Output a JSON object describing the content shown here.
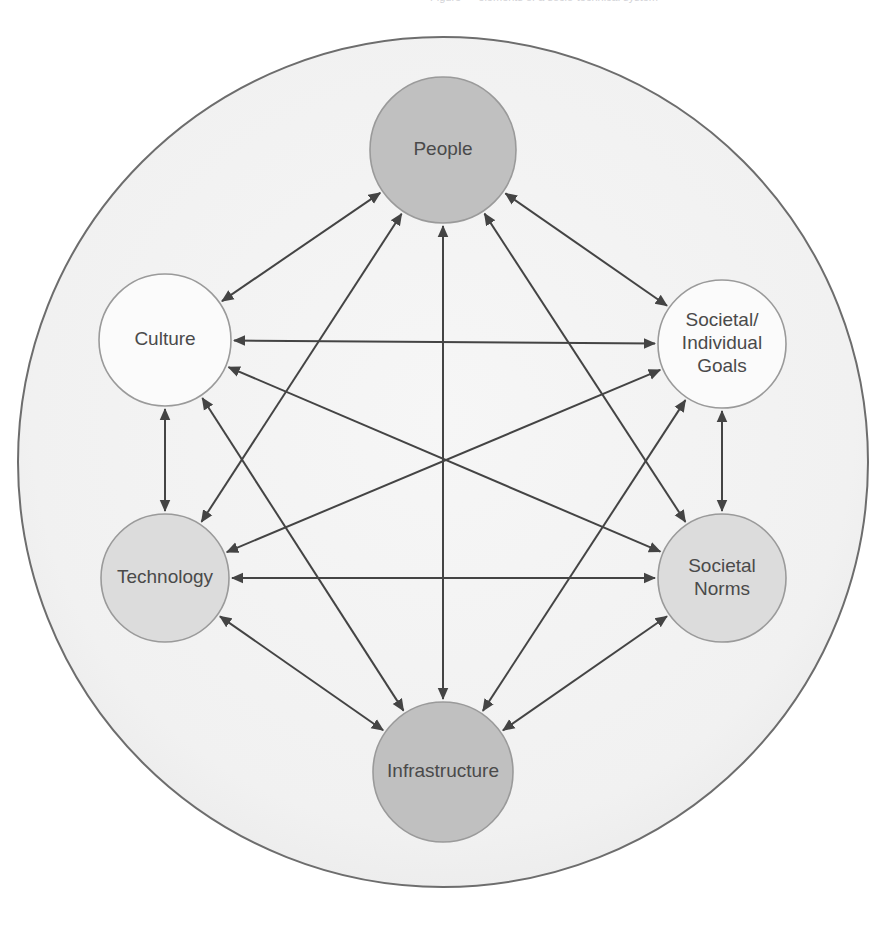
{
  "diagram": {
    "type": "node-link-diagram",
    "canvas": {
      "width": 896,
      "height": 930
    },
    "container": {
      "shape": "circle",
      "label": "outer-boundary-circle",
      "cx": 443,
      "cy": 462,
      "r": 425,
      "fill": "#f2f2f2",
      "stroke": "#6d6d6d",
      "stroke_width": 2
    },
    "colors": {
      "dark_node": "#c0c0c0",
      "mid_node": "#dcdcdc",
      "light_node": "#fbfbfb",
      "node_stroke": "#9a9a9a",
      "arrow": "#444444",
      "label_text": "#4a4a4a",
      "canvas_bg": "#ffffff",
      "boundary_fill": "#f2f2f2"
    },
    "nodes": [
      {
        "id": "people",
        "label": "People",
        "lines": [
          "People"
        ],
        "cx": 443,
        "cy": 150,
        "r": 73,
        "fill": "#c0c0c0",
        "tone": "dark"
      },
      {
        "id": "goals",
        "label": "Societal/Individual Goals",
        "lines": [
          "Societal/",
          "Individual",
          "Goals"
        ],
        "cx": 722,
        "cy": 344,
        "r": 64,
        "fill": "#fbfbfb",
        "tone": "light"
      },
      {
        "id": "norms",
        "label": "Societal Norms",
        "lines": [
          "Societal",
          "Norms"
        ],
        "cx": 722,
        "cy": 578,
        "r": 64,
        "fill": "#dcdcdc",
        "tone": "mid"
      },
      {
        "id": "infrastructure",
        "label": "Infrastructure",
        "lines": [
          "Infrastructure"
        ],
        "cx": 443,
        "cy": 772,
        "r": 70,
        "fill": "#c0c0c0",
        "tone": "dark"
      },
      {
        "id": "technology",
        "label": "Technology",
        "lines": [
          "Technology"
        ],
        "cx": 165,
        "cy": 578,
        "r": 64,
        "fill": "#dcdcdc",
        "tone": "mid"
      },
      {
        "id": "culture",
        "label": "Culture",
        "lines": [
          "Culture"
        ],
        "cx": 165,
        "cy": 340,
        "r": 66,
        "fill": "#fbfbfb",
        "tone": "light"
      }
    ],
    "edges": [
      {
        "id": "culture-people",
        "from": "culture",
        "to": "people",
        "arrows": "both",
        "kind": "adjacent"
      },
      {
        "id": "people-goals",
        "from": "people",
        "to": "goals",
        "arrows": "both",
        "kind": "adjacent"
      },
      {
        "id": "goals-norms",
        "from": "goals",
        "to": "norms",
        "arrows": "both",
        "kind": "adjacent"
      },
      {
        "id": "norms-infrastructure",
        "from": "norms",
        "to": "infrastructure",
        "arrows": "both",
        "kind": "adjacent"
      },
      {
        "id": "infrastructure-technology",
        "from": "infrastructure",
        "to": "technology",
        "arrows": "both",
        "kind": "adjacent"
      },
      {
        "id": "technology-culture",
        "from": "technology",
        "to": "culture",
        "arrows": "both",
        "kind": "adjacent"
      },
      {
        "id": "culture-goals",
        "from": "culture",
        "to": "goals",
        "arrows": "both",
        "kind": "chord"
      },
      {
        "id": "technology-norms",
        "from": "technology",
        "to": "norms",
        "arrows": "both",
        "kind": "chord"
      },
      {
        "id": "people-infrastructure",
        "from": "people",
        "to": "infrastructure",
        "arrows": "both",
        "kind": "diameter"
      },
      {
        "id": "culture-norms",
        "from": "culture",
        "to": "norms",
        "arrows": "both",
        "kind": "diameter"
      },
      {
        "id": "goals-technology",
        "from": "goals",
        "to": "technology",
        "arrows": "both",
        "kind": "diameter"
      },
      {
        "id": "people-norms",
        "from": "people",
        "to": "norms",
        "arrows": "both",
        "kind": "chord"
      },
      {
        "id": "people-technology",
        "from": "people",
        "to": "technology",
        "arrows": "both",
        "kind": "chord"
      },
      {
        "id": "goals-infrastructure",
        "from": "goals",
        "to": "infrastructure",
        "arrows": "both",
        "kind": "chord"
      },
      {
        "id": "culture-infrastructure",
        "from": "culture",
        "to": "infrastructure",
        "arrows": "both",
        "kind": "chord"
      }
    ],
    "caption_fragment": "Figure — elements of a socio-technical system"
  }
}
